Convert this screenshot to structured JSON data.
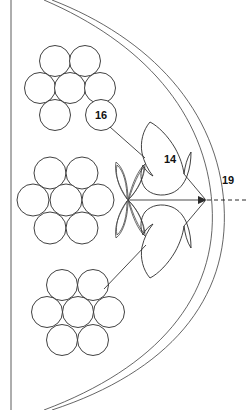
{
  "figure": {
    "background_color": "#ffffff",
    "line_color": "#2b2b2b",
    "width": 249,
    "height": 410
  },
  "labels": {
    "flame_upper": "14",
    "bubble_cluster": "16",
    "axis_right": "19"
  },
  "callouts": [
    {
      "id": "label-14",
      "text": "14",
      "x": 170,
      "y": 160,
      "target": "upper-flame-shape"
    },
    {
      "id": "label-16",
      "text": "16",
      "x": 101,
      "y": 115,
      "target": "upper-bubble-cluster"
    },
    {
      "id": "label-19",
      "text": "19",
      "x": 228,
      "y": 181,
      "target": "central-axis"
    }
  ],
  "clusters": [
    {
      "name": "upper-bubble-cluster",
      "label": "16",
      "arrangement": "hexagonal-7",
      "circle_radius": 15.5,
      "circles": [
        {
          "cx": 55,
          "cy": 61
        },
        {
          "cx": 85,
          "cy": 61
        },
        {
          "cx": 40,
          "cy": 88
        },
        {
          "cx": 70,
          "cy": 88
        },
        {
          "cx": 100,
          "cy": 88
        },
        {
          "cx": 55,
          "cy": 115
        },
        {
          "cx": 101,
          "cy": 115
        }
      ],
      "labeled_circle_index": 6
    },
    {
      "name": "middle-bubble-cluster",
      "label": "",
      "arrangement": "hexagonal-7",
      "circle_radius": 16.0,
      "circles": [
        {
          "cx": 50,
          "cy": 173
        },
        {
          "cx": 82,
          "cy": 173
        },
        {
          "cx": 33,
          "cy": 200
        },
        {
          "cx": 66,
          "cy": 200
        },
        {
          "cx": 98,
          "cy": 200
        },
        {
          "cx": 50,
          "cy": 228
        },
        {
          "cx": 82,
          "cy": 228
        }
      ],
      "labeled_circle_index": -1
    },
    {
      "name": "lower-bubble-cluster",
      "label": "",
      "arrangement": "hexagonal-7",
      "circle_radius": 15.5,
      "circles": [
        {
          "cx": 62,
          "cy": 285
        },
        {
          "cx": 93,
          "cy": 285
        },
        {
          "cx": 47,
          "cy": 312
        },
        {
          "cx": 78,
          "cy": 312
        },
        {
          "cx": 109,
          "cy": 312
        },
        {
          "cx": 62,
          "cy": 340
        },
        {
          "cx": 93,
          "cy": 340
        }
      ],
      "labeled_circle_index": -1
    }
  ],
  "shapes": [
    {
      "name": "upper-flame-shape",
      "label": "14",
      "kind": "flame"
    },
    {
      "name": "lower-flame-shape",
      "label": "",
      "kind": "flame-mirrored"
    },
    {
      "name": "four-petal-rosette",
      "label": "",
      "kind": "petal-quad",
      "center": {
        "x": 128,
        "y": 200
      }
    }
  ],
  "axis": {
    "name": "central-axis",
    "label": "19",
    "solid_from": {
      "x": 128,
      "y": 200
    },
    "convergence_point": {
      "x": 206,
      "y": 200
    },
    "dashed_to": {
      "x": 249,
      "y": 200
    }
  },
  "envelope": {
    "name": "curved-envelope",
    "description": "two nested arcs forming a lens-shaped boundary",
    "left_frame_x": 11
  }
}
